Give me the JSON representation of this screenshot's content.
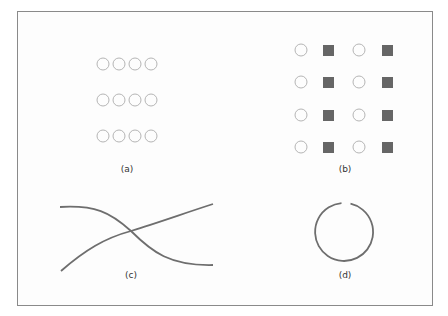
{
  "figure": {
    "panels": [
      {
        "id": "a",
        "label": "(a)",
        "description": "3x4 grid of hollow circles"
      },
      {
        "id": "b",
        "label": "(b)",
        "description": "4x4 grid alternating hollow circles and filled squares by column"
      },
      {
        "id": "c",
        "label": "(c)",
        "description": "two crossing curves"
      },
      {
        "id": "d",
        "label": "(d)",
        "description": "circle with a small gap at the top"
      }
    ]
  },
  "colors": {
    "frame": "#8a8a8a",
    "circle_stroke": "#b5b5b5",
    "square_fill": "#666666",
    "curve_stroke": "#6e6e6e"
  }
}
